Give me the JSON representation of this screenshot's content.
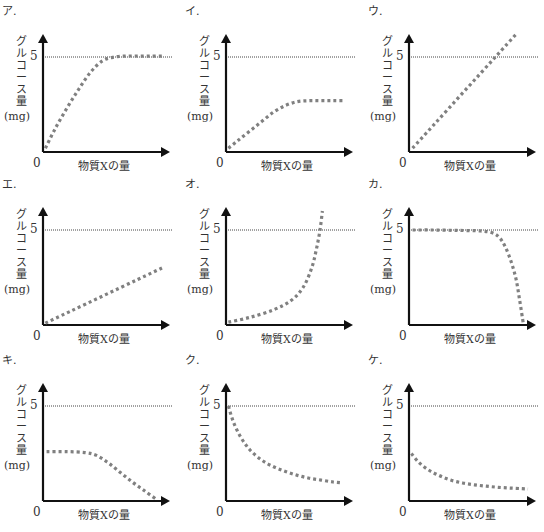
{
  "colors": {
    "axis": "#111111",
    "curve": "#808080",
    "reference": "#444444"
  },
  "common": {
    "ylabel_chars": [
      "グ",
      "ル",
      "コ",
      "ー",
      "ス",
      "量"
    ],
    "ylabel_unit": "(mg)",
    "xlabel": "物質Xの量",
    "origin": "0",
    "ref_tick": "5"
  },
  "chart_data": [
    {
      "type": "line",
      "label": "ア.",
      "title": "ア",
      "xlabel": "物質Xの量",
      "ylabel": "グルコース量(mg)",
      "ylim": [
        0,
        6.2
      ],
      "xlim": [
        0,
        10
      ],
      "reference_line": 5,
      "x": [
        0.2,
        1,
        2,
        3,
        4,
        5,
        6,
        7,
        8,
        9,
        10
      ],
      "y": [
        0.2,
        1.2,
        2.3,
        3.3,
        4.2,
        4.8,
        5.0,
        5.05,
        5.05,
        5.05,
        5.05
      ]
    },
    {
      "type": "line",
      "label": "イ.",
      "title": "イ",
      "xlabel": "物質Xの量",
      "ylabel": "グルコース量(mg)",
      "ylim": [
        0,
        6.2
      ],
      "xlim": [
        0,
        10
      ],
      "reference_line": 5,
      "x": [
        0.2,
        1,
        2,
        3,
        4,
        5,
        6,
        7,
        8,
        9,
        10
      ],
      "y": [
        0.2,
        0.6,
        1.1,
        1.6,
        2.1,
        2.45,
        2.65,
        2.7,
        2.7,
        2.7,
        2.7
      ]
    },
    {
      "type": "line",
      "label": "ウ.",
      "title": "ウ",
      "xlabel": "物質Xの量",
      "ylabel": "グルコース量(mg)",
      "ylim": [
        0,
        6.2
      ],
      "xlim": [
        0,
        10
      ],
      "reference_line": 5,
      "x": [
        0.3,
        9
      ],
      "y": [
        0.2,
        6.2
      ]
    },
    {
      "type": "line",
      "label": "エ.",
      "title": "エ",
      "xlabel": "物質Xの量",
      "ylabel": "グルコース量(mg)",
      "ylim": [
        0,
        6.2
      ],
      "xlim": [
        0,
        10
      ],
      "reference_line": 5,
      "x": [
        0.2,
        10
      ],
      "y": [
        0.1,
        3.0
      ]
    },
    {
      "type": "line",
      "label": "オ.",
      "title": "オ",
      "xlabel": "物質Xの量",
      "ylabel": "グルコース量(mg)",
      "ylim": [
        0,
        6.2
      ],
      "xlim": [
        0,
        10
      ],
      "reference_line": 5,
      "x": [
        0.2,
        2,
        4,
        5.5,
        6.5,
        7.2,
        7.6,
        7.9,
        8.1
      ],
      "y": [
        0.15,
        0.4,
        0.8,
        1.3,
        2.0,
        3.0,
        4.0,
        5.0,
        6.0
      ]
    },
    {
      "type": "line",
      "label": "カ.",
      "title": "カ",
      "xlabel": "物質Xの量",
      "ylabel": "グルコース量(mg)",
      "ylim": [
        0,
        6.2
      ],
      "xlim": [
        0,
        10
      ],
      "reference_line": 5,
      "x": [
        0.3,
        2,
        4,
        6,
        7,
        7.6,
        8.1,
        8.6,
        9.0,
        9.3,
        9.6
      ],
      "y": [
        5.0,
        5.0,
        4.98,
        4.95,
        4.85,
        4.6,
        4.1,
        3.3,
        2.4,
        1.3,
        0.1
      ]
    },
    {
      "type": "line",
      "label": "キ.",
      "title": "キ",
      "xlabel": "物質Xの量",
      "ylabel": "グルコース量(mg)",
      "ylim": [
        0,
        6.2
      ],
      "xlim": [
        0,
        10
      ],
      "reference_line": 5,
      "x": [
        0.3,
        2,
        3.5,
        4.5,
        5.5,
        6.5,
        7.5,
        8.5,
        9.5
      ],
      "y": [
        2.6,
        2.6,
        2.55,
        2.4,
        2.0,
        1.5,
        1.0,
        0.55,
        0.1
      ]
    },
    {
      "type": "line",
      "label": "ク.",
      "title": "ク",
      "xlabel": "物質Xの量",
      "ylabel": "グルコース量(mg)",
      "ylim": [
        0,
        6.2
      ],
      "xlim": [
        0,
        10
      ],
      "reference_line": 5,
      "x": [
        0.2,
        0.6,
        1.2,
        2,
        3,
        4,
        5,
        6,
        7,
        8,
        9,
        9.8
      ],
      "y": [
        5.0,
        4.2,
        3.4,
        2.7,
        2.15,
        1.8,
        1.55,
        1.35,
        1.2,
        1.1,
        1.0,
        0.95
      ]
    },
    {
      "type": "line",
      "label": "ケ.",
      "title": "ケ",
      "xlabel": "物質Xの量",
      "ylabel": "グルコース量(mg)",
      "ylim": [
        0,
        6.2
      ],
      "xlim": [
        0,
        10
      ],
      "reference_line": 5,
      "x": [
        0.2,
        0.8,
        1.6,
        2.5,
        3.5,
        4.5,
        5.5,
        6.5,
        7.5,
        8.5,
        9.5,
        10
      ],
      "y": [
        2.5,
        2.05,
        1.65,
        1.35,
        1.1,
        0.95,
        0.85,
        0.78,
        0.72,
        0.68,
        0.65,
        0.63
      ]
    }
  ]
}
